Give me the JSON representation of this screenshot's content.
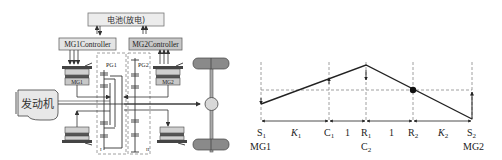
{
  "left_schematic": {
    "battery_label": "电池(放电)",
    "mg1_controller_label": "MG1Controller",
    "mg2_controller_label": "MG2Controller",
    "mg1_label": "MG1",
    "mg2_label": "MG2",
    "engine_label": "发动机",
    "pg1_label": "PG1",
    "pg2_label": "PG2",
    "zone1_label": "I",
    "zone2_label": "II"
  },
  "lever_diagram": {
    "nodes": [
      {
        "id": "S1",
        "label": "S",
        "sub": "1",
        "below": "MG1"
      },
      {
        "id": "C1",
        "label": "C",
        "sub": "1",
        "below": ""
      },
      {
        "id": "R1",
        "label": "R",
        "sub": "1",
        "below": "C",
        "below_sub": "2"
      },
      {
        "id": "R2",
        "label": "R",
        "sub": "2",
        "below": ""
      },
      {
        "id": "S2",
        "label": "S",
        "sub": "2",
        "below": "MG2"
      }
    ],
    "spans": [
      {
        "label": "K",
        "sub": "1"
      },
      {
        "label": "1",
        "sub": ""
      },
      {
        "label": "1",
        "sub": ""
      },
      {
        "label": "K",
        "sub": "2"
      }
    ]
  }
}
